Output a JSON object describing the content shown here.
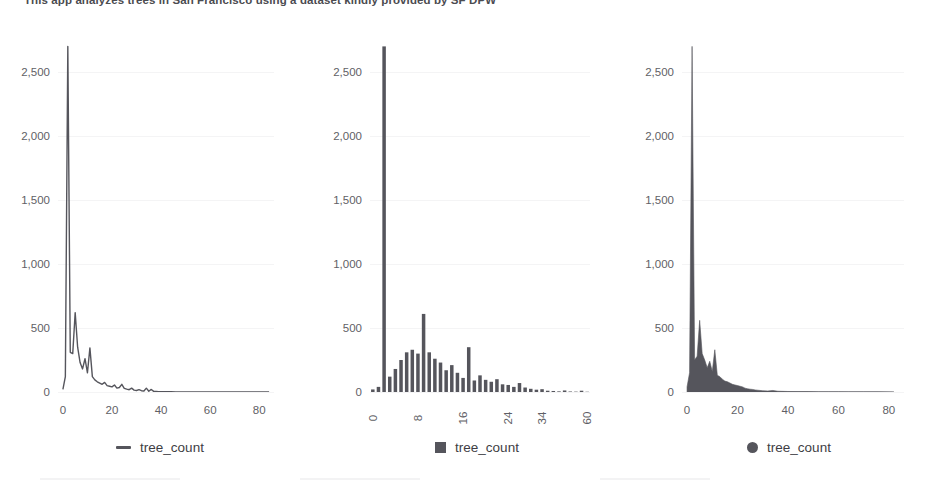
{
  "intro": {
    "text": "This app analyzes trees in San Francisco using a dataset kindly provided by SF DPW"
  },
  "colors": {
    "series": "#55555c",
    "axis_text": "#5f5f66",
    "gridline": "#f4f4f5",
    "background": "#ffffff"
  },
  "legends": [
    {
      "marker": "line-marker-icon",
      "label": "tree_count"
    },
    {
      "marker": "square-marker-icon",
      "label": "tree_count"
    },
    {
      "marker": "circle-marker-icon",
      "label": "tree_count"
    }
  ],
  "chart_data": [
    {
      "type": "line",
      "title": "",
      "xlabel": "",
      "ylabel": "",
      "series_name": "tree_count",
      "grid": true,
      "legend_position": "bottom",
      "xlim": [
        -2,
        86
      ],
      "ylim": [
        0,
        2750
      ],
      "xticks": [
        0,
        20,
        40,
        60,
        80
      ],
      "yticks": [
        0,
        500,
        1000,
        1500,
        2000,
        2500
      ],
      "ytick_labels": [
        "0",
        "500",
        "1,000",
        "1,500",
        "2,000",
        "2,500"
      ],
      "x": [
        0,
        1,
        2,
        3,
        4,
        5,
        6,
        7,
        8,
        9,
        10,
        11,
        12,
        13,
        14,
        15,
        16,
        17,
        18,
        19,
        20,
        21,
        22,
        23,
        24,
        25,
        26,
        27,
        28,
        29,
        30,
        31,
        32,
        33,
        34,
        35,
        36,
        37,
        38,
        39,
        40,
        42,
        44,
        46,
        48,
        50,
        52,
        55,
        60,
        65,
        70,
        75,
        80,
        84
      ],
      "values": [
        20,
        120,
        2700,
        310,
        300,
        620,
        350,
        230,
        180,
        260,
        150,
        345,
        120,
        95,
        80,
        70,
        60,
        75,
        50,
        45,
        40,
        55,
        30,
        35,
        60,
        28,
        22,
        18,
        30,
        15,
        12,
        18,
        10,
        8,
        30,
        6,
        20,
        5,
        4,
        3,
        3,
        2,
        2,
        1,
        1,
        1,
        1,
        1,
        1,
        0,
        0,
        0,
        0,
        0
      ]
    },
    {
      "type": "bar",
      "title": "",
      "xlabel": "",
      "ylabel": "",
      "series_name": "tree_count",
      "grid": true,
      "legend_position": "bottom",
      "ylim": [
        0,
        2750
      ],
      "yticks": [
        0,
        500,
        1000,
        1500,
        2000,
        2500
      ],
      "ytick_labels": [
        "0",
        "500",
        "1,000",
        "1,500",
        "2,000",
        "2,500"
      ],
      "xticks_labels": [
        "0",
        "8",
        "16",
        "24",
        "34",
        "60"
      ],
      "xticks_index": [
        0,
        8,
        16,
        24,
        30,
        38
      ],
      "categories": [
        "0",
        "1",
        "2",
        "3",
        "4",
        "5",
        "6",
        "7",
        "8",
        "9",
        "10",
        "11",
        "12",
        "13",
        "14",
        "15",
        "16",
        "17",
        "18",
        "19",
        "20",
        "21",
        "22",
        "23",
        "24",
        "26",
        "28",
        "30",
        "32",
        "34",
        "36",
        "40",
        "44",
        "48",
        "52",
        "56",
        "60",
        "64",
        "70"
      ],
      "values": [
        20,
        40,
        2700,
        120,
        180,
        250,
        310,
        330,
        300,
        610,
        310,
        260,
        230,
        170,
        210,
        150,
        110,
        350,
        90,
        130,
        95,
        80,
        100,
        60,
        55,
        40,
        70,
        35,
        25,
        18,
        22,
        10,
        8,
        5,
        12,
        4,
        3,
        10,
        2
      ]
    },
    {
      "type": "area",
      "title": "",
      "xlabel": "",
      "ylabel": "",
      "series_name": "tree_count",
      "grid": true,
      "legend_position": "bottom",
      "xlim": [
        -2,
        86
      ],
      "ylim": [
        0,
        2750
      ],
      "xticks": [
        0,
        20,
        40,
        60,
        80
      ],
      "yticks": [
        0,
        500,
        1000,
        1500,
        2000,
        2500
      ],
      "ytick_labels": [
        "0",
        "500",
        "1,000",
        "1,500",
        "2,000",
        "2,500"
      ],
      "x": [
        0,
        1,
        2,
        3,
        4,
        5,
        6,
        7,
        8,
        9,
        10,
        11,
        12,
        13,
        14,
        15,
        16,
        17,
        18,
        19,
        20,
        21,
        22,
        23,
        24,
        25,
        26,
        27,
        28,
        30,
        32,
        34,
        36,
        38,
        40,
        44,
        48,
        52,
        56,
        60,
        64,
        70,
        76,
        82
      ],
      "values": [
        40,
        150,
        2700,
        250,
        280,
        560,
        300,
        250,
        190,
        240,
        160,
        330,
        130,
        120,
        100,
        85,
        80,
        70,
        60,
        55,
        50,
        45,
        40,
        30,
        25,
        22,
        20,
        16,
        14,
        10,
        8,
        12,
        6,
        5,
        4,
        3,
        3,
        2,
        2,
        2,
        1,
        1,
        1,
        0
      ]
    }
  ]
}
